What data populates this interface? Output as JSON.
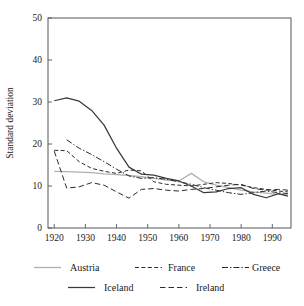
{
  "chart_data": {
    "type": "line",
    "title": "",
    "xlabel": "",
    "ylabel": "Standard deviation",
    "xlim": [
      1918,
      1996
    ],
    "ylim": [
      0,
      50
    ],
    "xticks": [
      1920,
      1930,
      1940,
      1950,
      1960,
      1970,
      1980,
      1990
    ],
    "yticks": [
      0,
      10,
      20,
      30,
      40,
      50
    ],
    "grid": false,
    "legend_position": "bottom",
    "series": [
      {
        "name": "Austria",
        "style": "solid-light",
        "color": "#b0b0b0",
        "x": [
          1920,
          1924,
          1928,
          1932,
          1936,
          1940,
          1944,
          1948,
          1952,
          1956,
          1960,
          1964,
          1968,
          1972,
          1976,
          1980,
          1984,
          1988,
          1992,
          1995
        ],
        "y": [
          13.5,
          13.4,
          13.3,
          13.2,
          12.9,
          12.7,
          12.5,
          12.2,
          11.8,
          11.4,
          11.2,
          13.0,
          11.0,
          10.2,
          9.6,
          9.0,
          8.6,
          8.3,
          8.0,
          7.9
        ]
      },
      {
        "name": "France",
        "style": "dotted",
        "color": "#2a2a2a",
        "x": [
          1920,
          1924,
          1928,
          1932,
          1936,
          1940,
          1944,
          1948,
          1952,
          1956,
          1960,
          1964,
          1968,
          1972,
          1976,
          1980,
          1984,
          1988,
          1992,
          1995
        ],
        "y": [
          18.5,
          18.4,
          15.8,
          14.2,
          13.5,
          13.0,
          13.8,
          13.6,
          11.0,
          10.4,
          10.2,
          10.0,
          10.4,
          10.8,
          10.6,
          10.2,
          9.6,
          9.2,
          8.8,
          8.6
        ]
      },
      {
        "name": "Greece",
        "style": "dash-dot",
        "color": "#2a2a2a",
        "x": [
          1924,
          1928,
          1932,
          1936,
          1940,
          1944,
          1948,
          1952,
          1956,
          1960,
          1964,
          1968,
          1972,
          1976,
          1980,
          1984,
          1988,
          1992,
          1995
        ],
        "y": [
          21.0,
          19.0,
          17.5,
          15.8,
          14.0,
          12.4,
          11.8,
          12.0,
          11.6,
          11.0,
          10.4,
          9.6,
          9.0,
          8.4,
          8.0,
          8.4,
          8.8,
          8.4,
          8.2
        ]
      },
      {
        "name": "Iceland",
        "style": "solid",
        "color": "#3a3a3a",
        "x": [
          1920,
          1924,
          1928,
          1932,
          1936,
          1940,
          1944,
          1948,
          1952,
          1956,
          1960,
          1964,
          1968,
          1972,
          1976,
          1980,
          1984,
          1988,
          1992,
          1995
        ],
        "y": [
          30.3,
          31.0,
          30.2,
          28.0,
          24.5,
          19.0,
          14.5,
          12.8,
          12.6,
          11.8,
          11.2,
          10.0,
          8.4,
          8.6,
          9.4,
          9.6,
          8.0,
          7.2,
          8.2,
          7.6
        ]
      },
      {
        "name": "Ireland",
        "style": "dashed",
        "color": "#2a2a2a",
        "x": [
          1920,
          1924,
          1928,
          1932,
          1936,
          1940,
          1944,
          1948,
          1952,
          1956,
          1960,
          1964,
          1968,
          1972,
          1976,
          1980,
          1984,
          1988,
          1992,
          1995
        ],
        "y": [
          18.3,
          9.5,
          9.8,
          10.8,
          10.2,
          8.6,
          7.1,
          9.2,
          9.4,
          9.0,
          8.8,
          9.2,
          9.4,
          9.8,
          10.2,
          10.4,
          9.4,
          9.0,
          9.2,
          9.0
        ]
      }
    ],
    "legend": [
      {
        "label": "Austria",
        "style": "solid-light"
      },
      {
        "label": "France",
        "style": "dotted"
      },
      {
        "label": "Greece",
        "style": "dash-dot"
      },
      {
        "label": "Iceland",
        "style": "solid"
      },
      {
        "label": "Ireland",
        "style": "dashed"
      }
    ]
  }
}
